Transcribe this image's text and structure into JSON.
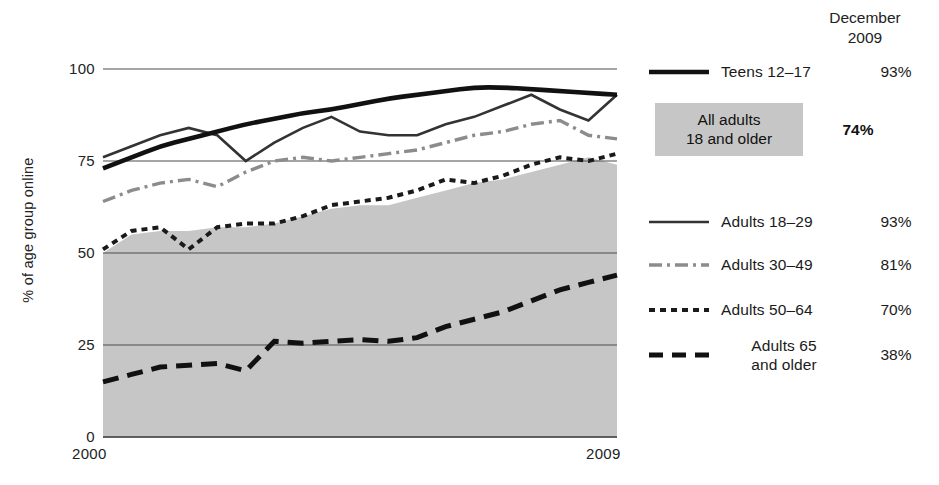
{
  "chart_data": {
    "type": "line",
    "title": "",
    "subtitle": "",
    "xlabel": "",
    "ylabel": "% of age group online",
    "xlim": [
      2000,
      2009
    ],
    "ylim": [
      0,
      100
    ],
    "yticks": [
      0,
      25,
      50,
      75,
      100
    ],
    "ytick_labels": [
      "0",
      "25",
      "50",
      "75",
      "100"
    ],
    "xticks": [
      2000,
      2009
    ],
    "xtick_labels": [
      "2000",
      "2009"
    ],
    "grid": "horizontal",
    "legend_position": "right",
    "x": [
      2000,
      2000.5,
      2001,
      2001.5,
      2002,
      2002.5,
      2003,
      2003.5,
      2004,
      2004.5,
      2005,
      2005.5,
      2006,
      2006.5,
      2007,
      2007.5,
      2008,
      2008.5,
      2009
    ],
    "series": [
      {
        "name": "Teens 12-17",
        "style": "solid-thick-black",
        "color": "#111111",
        "values": [
          73,
          76,
          79,
          81,
          83,
          85,
          86.5,
          88,
          89,
          90.5,
          92,
          93,
          94,
          95,
          95,
          94.5,
          94,
          93.5,
          93
        ],
        "december_2009": "93%"
      },
      {
        "name": "Adults 18-29",
        "style": "solid-thin",
        "color": "#333333",
        "values": [
          76,
          79,
          82,
          84,
          82,
          75,
          80,
          84,
          87,
          83,
          82,
          82,
          85,
          87,
          90,
          93,
          89,
          86,
          93
        ],
        "december_2009": "93%"
      },
      {
        "name": "Adults 30-49",
        "style": "dash-dot",
        "color": "#8c8c8c",
        "values": [
          64,
          67,
          69,
          70,
          68,
          72,
          75,
          76,
          75,
          76,
          77,
          78,
          80,
          82,
          83,
          85,
          86,
          82,
          81
        ],
        "december_2009": "81%"
      },
      {
        "name": "Adults 50-64",
        "style": "dotted",
        "color": "#1a1a1a",
        "values": [
          51,
          56,
          57,
          51,
          57,
          58,
          58,
          60,
          63,
          64,
          65,
          67,
          70,
          69,
          71,
          74,
          76,
          75,
          77
        ],
        "december_2009": "70%"
      },
      {
        "name": "Adults 65 and older",
        "style": "dashed-thick",
        "color": "#111111",
        "values": [
          15,
          17,
          19,
          19.5,
          20,
          18,
          26,
          25.5,
          26,
          26.5,
          26,
          27,
          30,
          32,
          34,
          37,
          40,
          42,
          44
        ],
        "december_2009": "38%"
      },
      {
        "name": "All adults 18 and older",
        "style": "filled-area",
        "color": "#c6c6c6",
        "values": [
          50,
          55,
          56,
          56,
          57,
          57,
          58,
          60,
          62,
          63,
          63,
          65,
          67,
          69,
          70,
          72,
          74,
          76,
          74
        ],
        "december_2009": "74%"
      }
    ]
  },
  "axes": {
    "y_title": "% of age group online",
    "y_labels": [
      "100",
      "75",
      "50",
      "25",
      "0"
    ],
    "x_labels": [
      "2000",
      "2009"
    ]
  },
  "legend": {
    "header_line1": "December",
    "header_line2": "2009",
    "teens": {
      "label": "Teens 12–17",
      "value": "93%"
    },
    "all_adults": {
      "line1": "All adults",
      "line2": "18 and older",
      "value": "74%"
    },
    "rows": [
      {
        "label": "Adults 18–29",
        "value": "93%",
        "style": "solid"
      },
      {
        "label": "Adults 30–49",
        "value": "81%",
        "style": "dashdot"
      },
      {
        "label": "Adults 50–64",
        "value": "70%",
        "style": "dotted"
      },
      {
        "label": "Adults 65\nand older",
        "value": "38%",
        "style": "dashed"
      }
    ],
    "row4_line1": "Adults 65",
    "row4_line2": "and older"
  },
  "colors": {
    "area_fill": "#c6c6c6",
    "grid": "#4d4d4d",
    "teens_line": "#111111",
    "adults1829": "#333333",
    "adults3049": "#8c8c8c",
    "adults5064": "#1a1a1a",
    "adults65": "#111111"
  }
}
